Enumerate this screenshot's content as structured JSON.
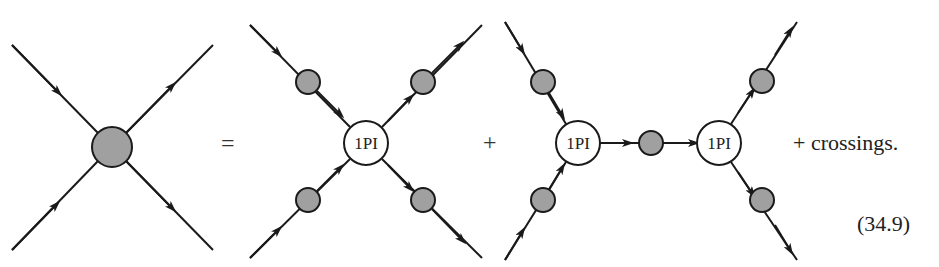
{
  "equation": {
    "equals": "=",
    "plus": "+",
    "tail_text": "+ crossings.",
    "equation_number": "(34.9)"
  },
  "vertex_label": "1PI",
  "colors": {
    "blob_fill": "#a0a0a0",
    "stroke": "#1a1a1a",
    "vertex_fill": "#ffffff"
  },
  "diagrams": [
    {
      "name": "full-four-point-function",
      "description": "Four external lines meeting at a shaded blob"
    },
    {
      "name": "1PI-vertex-with-dressed-propagators",
      "description": "1PI vertex with four full propagators"
    },
    {
      "name": "two-1PI-vertices-joined-by-propagator",
      "description": "Two 1PI vertices connected by a full propagator"
    }
  ]
}
